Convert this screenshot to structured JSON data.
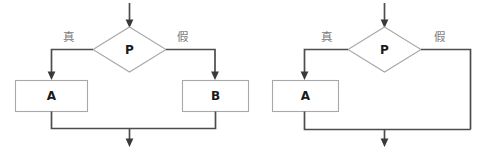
{
  "diagram": {
    "type": "flowchart",
    "background_color": "#ffffff",
    "shape_stroke_color": "#a8a8a8",
    "connector_color": "#4d4d4d",
    "label_color": "#1a1a1a",
    "branch_label_color": "#7a7a7a",
    "charts": [
      {
        "id": "if-else",
        "title": "",
        "nodes": [
          {
            "id": "decision-left",
            "shape": "diamond",
            "label": "P"
          },
          {
            "id": "process-a-left",
            "shape": "rectangle",
            "label": "A"
          },
          {
            "id": "process-b-left",
            "shape": "rectangle",
            "label": "B"
          }
        ],
        "edges": [
          {
            "id": "entry-left",
            "from": "",
            "to": "decision-left",
            "label": ""
          },
          {
            "id": "true-left",
            "from": "decision-left",
            "to": "process-a-left",
            "label": "真"
          },
          {
            "id": "false-left",
            "from": "decision-left",
            "to": "process-b-left",
            "label": "假"
          },
          {
            "id": "merge-left",
            "from": "process-a-left",
            "to": "exit",
            "label": ""
          }
        ]
      },
      {
        "id": "if-only",
        "title": "",
        "nodes": [
          {
            "id": "decision-right",
            "shape": "diamond",
            "label": "P"
          },
          {
            "id": "process-a-right",
            "shape": "rectangle",
            "label": "A"
          }
        ],
        "edges": [
          {
            "id": "entry-right",
            "from": "",
            "to": "decision-right",
            "label": ""
          },
          {
            "id": "true-right",
            "from": "decision-right",
            "to": "process-a-right",
            "label": "真"
          },
          {
            "id": "false-right",
            "from": "decision-right",
            "to": "exit",
            "label": "假"
          },
          {
            "id": "merge-right",
            "from": "process-a-right",
            "to": "exit",
            "label": ""
          }
        ]
      }
    ]
  },
  "labels": {
    "left": {
      "decision": "P",
      "process_a": "A",
      "process_b": "B",
      "true_branch": "真",
      "false_branch": "假"
    },
    "right": {
      "decision": "P",
      "process_a": "A",
      "true_branch": "真",
      "false_branch": "假"
    }
  }
}
